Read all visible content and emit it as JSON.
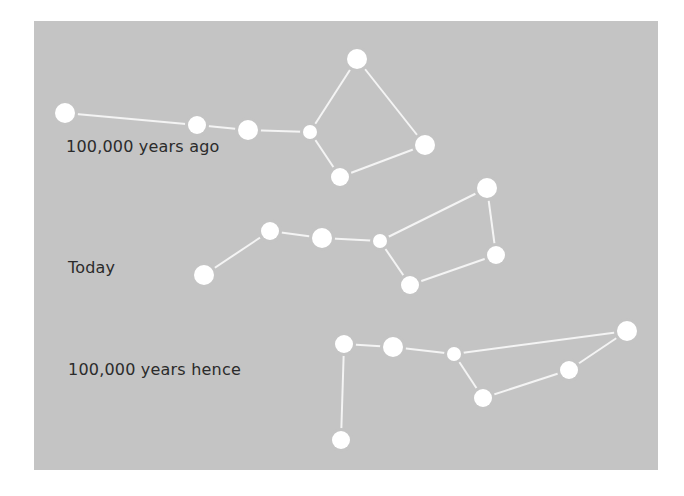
{
  "diagram": {
    "background_color": "#c4c4c4",
    "star_color": "#ffffff",
    "line_color": "#f4f4f4",
    "text_color": "#2b2b2b",
    "panels": [
      {
        "label": "100,000 years ago",
        "label_pos": [
          66,
          139
        ],
        "stars": [
          {
            "x": 65,
            "y": 113,
            "r": 10
          },
          {
            "x": 197,
            "y": 125,
            "r": 9
          },
          {
            "x": 248,
            "y": 130,
            "r": 10
          },
          {
            "x": 310,
            "y": 132,
            "r": 7
          },
          {
            "x": 357,
            "y": 59,
            "r": 10
          },
          {
            "x": 425,
            "y": 145,
            "r": 10
          },
          {
            "x": 340,
            "y": 177,
            "r": 9
          }
        ],
        "edges": [
          [
            0,
            1
          ],
          [
            1,
            2
          ],
          [
            2,
            3
          ],
          [
            3,
            4
          ],
          [
            4,
            5
          ],
          [
            5,
            6
          ],
          [
            6,
            3
          ]
        ]
      },
      {
        "label": "Today",
        "label_pos": [
          68,
          260
        ],
        "stars": [
          {
            "x": 204,
            "y": 275,
            "r": 10
          },
          {
            "x": 270,
            "y": 231,
            "r": 9
          },
          {
            "x": 322,
            "y": 238,
            "r": 10
          },
          {
            "x": 380,
            "y": 241,
            "r": 7
          },
          {
            "x": 487,
            "y": 188,
            "r": 10
          },
          {
            "x": 496,
            "y": 255,
            "r": 9
          },
          {
            "x": 410,
            "y": 285,
            "r": 9
          }
        ],
        "edges": [
          [
            0,
            1
          ],
          [
            1,
            2
          ],
          [
            2,
            3
          ],
          [
            3,
            4
          ],
          [
            4,
            5
          ],
          [
            5,
            6
          ],
          [
            6,
            3
          ]
        ]
      },
      {
        "label": "100,000 years hence",
        "label_pos": [
          68,
          362
        ],
        "stars": [
          {
            "x": 341,
            "y": 440,
            "r": 9
          },
          {
            "x": 344,
            "y": 344,
            "r": 9
          },
          {
            "x": 393,
            "y": 347,
            "r": 10
          },
          {
            "x": 454,
            "y": 354,
            "r": 7
          },
          {
            "x": 627,
            "y": 331,
            "r": 10
          },
          {
            "x": 569,
            "y": 370,
            "r": 9
          },
          {
            "x": 483,
            "y": 398,
            "r": 9
          }
        ],
        "edges": [
          [
            0,
            1
          ],
          [
            1,
            2
          ],
          [
            2,
            3
          ],
          [
            3,
            4
          ],
          [
            4,
            5
          ],
          [
            5,
            6
          ],
          [
            6,
            3
          ]
        ]
      }
    ]
  }
}
